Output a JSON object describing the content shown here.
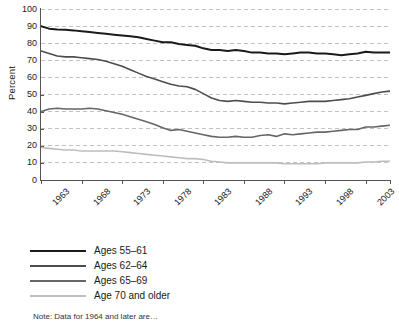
{
  "chart_data": {
    "type": "line",
    "title": "",
    "xlabel": "",
    "ylabel": "Percent",
    "ylim": [
      0,
      100
    ],
    "ytick_values": [
      0,
      10,
      20,
      30,
      40,
      50,
      60,
      70,
      80,
      90,
      100
    ],
    "ytick_labels": [
      "0",
      "10",
      "20",
      "30",
      "40",
      "50",
      "60",
      "70",
      "80",
      "90",
      "100"
    ],
    "xlim": [
      1963,
      2006
    ],
    "xtick_values": [
      1963,
      1968,
      1973,
      1978,
      1983,
      1988,
      1993,
      1998,
      2003,
      2006
    ],
    "xtick_labels": [
      "1963",
      "1968",
      "1973",
      "1978",
      "1983",
      "1988",
      "1993",
      "1998",
      "2003",
      "2006"
    ],
    "grid": "horizontal-dashed",
    "legend_position": "below-plot-left",
    "x": [
      1963,
      1964,
      1965,
      1966,
      1967,
      1968,
      1969,
      1970,
      1971,
      1972,
      1973,
      1974,
      1975,
      1976,
      1977,
      1978,
      1979,
      1980,
      1981,
      1982,
      1983,
      1984,
      1985,
      1986,
      1987,
      1988,
      1989,
      1990,
      1991,
      1992,
      1993,
      1994,
      1995,
      1996,
      1997,
      1998,
      1999,
      2000,
      2001,
      2002,
      2003,
      2004,
      2005,
      2006
    ],
    "series": [
      {
        "name": "Ages 55–61",
        "color": "#1a1a1a",
        "width": 2.0,
        "values": [
          90,
          88.5,
          88,
          87.8,
          87.5,
          87,
          86.5,
          86,
          85.5,
          85,
          84.5,
          84,
          83.5,
          82.5,
          81.5,
          80.5,
          80.5,
          79.5,
          79,
          78.5,
          77,
          76,
          76,
          75.5,
          76,
          75.5,
          74.5,
          74.5,
          74,
          74,
          73.5,
          74,
          74.5,
          74.5,
          74,
          74,
          73.5,
          73,
          73.5,
          74,
          75,
          74.5,
          74.5,
          74.5
        ]
      },
      {
        "name": "Ages 62–64",
        "color": "#4d4d4d",
        "width": 1.6,
        "values": [
          75.5,
          74,
          72.5,
          72,
          72,
          71.5,
          71,
          70.5,
          69.5,
          68,
          66.5,
          64.5,
          62.5,
          60.5,
          59,
          57.5,
          56,
          55,
          54.5,
          53,
          50.5,
          48,
          46.5,
          46,
          46.5,
          46,
          45.5,
          45.5,
          45,
          45,
          44.5,
          45,
          45.5,
          46,
          46,
          46,
          46.5,
          47,
          47.5,
          48.5,
          49.5,
          50.5,
          51.5,
          52
        ]
      },
      {
        "name": "Ages 65–69",
        "color": "#666666",
        "width": 1.6,
        "values": [
          40,
          41.5,
          42,
          41.5,
          41.5,
          41.5,
          42,
          41.5,
          40.5,
          39.5,
          38.5,
          37,
          35.5,
          34,
          32.5,
          30.5,
          29,
          29.5,
          28.5,
          27.5,
          26.5,
          25.5,
          25,
          25,
          25.5,
          25,
          25,
          26,
          26.5,
          25.5,
          27,
          26.5,
          27,
          27.5,
          28,
          28,
          28.5,
          29,
          29.5,
          29.5,
          31,
          31,
          31.5,
          32
        ]
      },
      {
        "name": "Age 70 and older",
        "color": "#bdbdbd",
        "width": 1.6,
        "values": [
          19,
          18.5,
          18,
          17.5,
          17.5,
          17,
          17,
          17,
          17,
          17,
          16.5,
          16,
          15.5,
          15,
          14.5,
          14,
          13.5,
          13,
          12.5,
          12.5,
          12,
          11,
          10.5,
          10,
          10,
          10,
          10,
          10,
          10,
          10,
          9.5,
          9.5,
          9.5,
          9.5,
          9.5,
          10,
          10,
          10,
          10,
          10,
          10.5,
          10.5,
          11,
          11
        ]
      }
    ]
  },
  "legend": {
    "items": [
      {
        "label": "Ages 55–61"
      },
      {
        "label": "Ages 62–64"
      },
      {
        "label": "Ages 65–69"
      },
      {
        "label": "Age 70 and older"
      }
    ]
  },
  "note": {
    "text": "Note: Data for 1964 and later are…"
  }
}
